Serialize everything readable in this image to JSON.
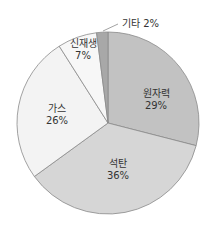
{
  "chart_data": {
    "type": "pie",
    "title": "",
    "start_angle_deg": 0,
    "direction": "clockwise",
    "center": [
      108,
      123
    ],
    "radius": 91,
    "slices": [
      {
        "label": "원자력",
        "value": 29,
        "pct_text": "29%",
        "color": "#c2c2c2",
        "label_pos": [
          156,
          100
        ],
        "inside": true
      },
      {
        "label": "석탄",
        "value": 36,
        "pct_text": "36%",
        "color": "#d6d6d6",
        "label_pos": [
          118,
          170
        ],
        "inside": true
      },
      {
        "label": "가스",
        "value": 26,
        "pct_text": "26%",
        "color": "#f3f3f3",
        "label_pos": [
          57,
          115
        ],
        "inside": true
      },
      {
        "label": "신재생",
        "value": 7,
        "pct_text": "7%",
        "color": "#f7f7f7",
        "label_pos": [
          83,
          50
        ],
        "inside": true
      },
      {
        "label": "기타",
        "value": 2,
        "pct_text": "2%",
        "color": "#a8a8a8",
        "label_pos": [
          122,
          18
        ],
        "inside": false,
        "leader": [
          [
            103,
            31
          ],
          [
            118,
            24
          ]
        ]
      }
    ],
    "stroke_color": "#8a8a8a",
    "legend": null
  },
  "labels": {
    "nuclear_name": "원자력",
    "nuclear_pct": "29%",
    "coal_name": "석탄",
    "coal_pct": "36%",
    "gas_name": "가스",
    "gas_pct": "26%",
    "renew_name": "신재생",
    "renew_pct": "7%",
    "other_text": "기타 2%"
  }
}
